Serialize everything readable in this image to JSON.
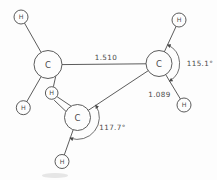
{
  "figure": {
    "atoms": {
      "carbon_symbol": "C",
      "hydrogen_symbol": "H"
    },
    "measurements": {
      "cc_bond_length": "1.510",
      "ch_bond_length": "1.089",
      "hch_angle": "115.1°",
      "hcc_angle": "117.7°"
    },
    "colors": {
      "ink": "#4a4a4a",
      "background": "#fdfdfd"
    }
  }
}
